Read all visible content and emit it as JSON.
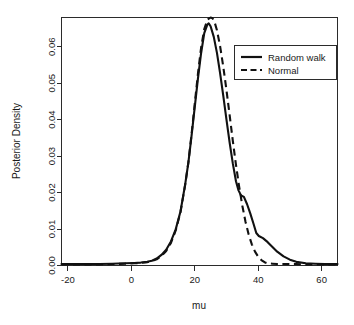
{
  "chart_data": {
    "type": "line",
    "title": "",
    "xlabel": "mu",
    "ylabel": "Posterior Density",
    "xlim": [
      -22,
      65
    ],
    "ylim": [
      0,
      0.068
    ],
    "grid": false,
    "legend_position": "top-right",
    "xticks": [
      -20,
      0,
      20,
      40,
      60
    ],
    "xtick_labels": [
      "-20",
      "0",
      "20",
      "40",
      "60"
    ],
    "yticks": [
      0.0,
      0.01,
      0.02,
      0.03,
      0.04,
      0.05,
      0.06
    ],
    "ytick_labels": [
      "0.00",
      "0.01",
      "0.02",
      "0.03",
      "0.04",
      "0.05",
      "0.06"
    ],
    "series": [
      {
        "name": "Random walk",
        "style": "solid",
        "color": "#111111",
        "x": [
          -22,
          -18,
          -14,
          -10,
          -6,
          -2,
          1,
          3,
          5,
          6.5,
          8,
          9.5,
          11,
          12.5,
          14,
          15.5,
          17,
          18,
          19,
          20,
          21,
          22,
          23,
          24,
          24.4,
          25,
          26,
          27,
          28,
          29,
          30,
          31,
          32,
          33,
          33.8,
          34.6,
          35.5,
          36.5,
          37.5,
          38.5,
          39.4,
          40.2,
          41.5,
          43,
          44.5,
          46,
          48,
          50,
          52,
          55,
          58,
          61,
          65
        ],
        "y": [
          0.0004,
          0.0004,
          0.0004,
          0.0004,
          0.0005,
          0.0006,
          0.0007,
          0.0008,
          0.001,
          0.0013,
          0.0019,
          0.0029,
          0.0043,
          0.0066,
          0.0099,
          0.0148,
          0.0223,
          0.0283,
          0.0356,
          0.0434,
          0.0512,
          0.0582,
          0.0637,
          0.0661,
          0.0664,
          0.0656,
          0.0627,
          0.0583,
          0.0527,
          0.0465,
          0.04,
          0.0337,
          0.028,
          0.0231,
          0.0206,
          0.0192,
          0.0188,
          0.0168,
          0.0143,
          0.0115,
          0.0089,
          0.0081,
          0.0075,
          0.0064,
          0.0051,
          0.0038,
          0.0025,
          0.0016,
          0.001,
          0.0006,
          0.0005,
          0.0004,
          0.0004
        ]
      },
      {
        "name": "Normal",
        "style": "dashed",
        "color": "#111111",
        "x": [
          -22,
          -18,
          -14,
          -10,
          -6,
          -2,
          1,
          3,
          5,
          6.5,
          8,
          9.5,
          11,
          12.5,
          14,
          15.5,
          17,
          18,
          19,
          20,
          21,
          22,
          23,
          24,
          25,
          25.6,
          26.2,
          27,
          28,
          29,
          30,
          31,
          32,
          33,
          34,
          35,
          36,
          37,
          38,
          39,
          40,
          41,
          42,
          43,
          44.5,
          46,
          48,
          50,
          52,
          55,
          58,
          61,
          65
        ],
        "y": [
          0.0003,
          0.0003,
          0.0003,
          0.0003,
          0.0004,
          0.0005,
          0.0006,
          0.0007,
          0.0009,
          0.0012,
          0.0017,
          0.0026,
          0.004,
          0.0062,
          0.0096,
          0.0146,
          0.0222,
          0.0283,
          0.036,
          0.0443,
          0.0525,
          0.0597,
          0.0648,
          0.0674,
          0.068,
          0.0678,
          0.0669,
          0.0645,
          0.0601,
          0.0545,
          0.0481,
          0.0412,
          0.0342,
          0.0276,
          0.0216,
          0.0164,
          0.012,
          0.0085,
          0.0058,
          0.0038,
          0.0024,
          0.0015,
          0.0009,
          0.0006,
          0.0005,
          0.0004,
          0.0004,
          0.0004,
          0.0004,
          0.0003,
          0.0003,
          0.0003,
          0.0003
        ]
      }
    ],
    "legend": [
      {
        "label": "Random walk",
        "style": "solid"
      },
      {
        "label": "Normal",
        "style": "dashed"
      }
    ]
  }
}
